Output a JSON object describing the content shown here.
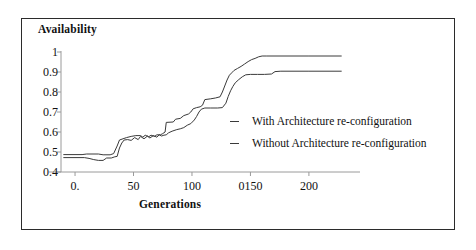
{
  "figure": {
    "frame_color": "#2b2b2b",
    "background": "#ffffff"
  },
  "chart_data": {
    "type": "line",
    "title": "",
    "ylabel": "Availability",
    "xlabel": "Generations",
    "xlim": [
      -12,
      230
    ],
    "ylim": [
      0.4,
      1.0
    ],
    "grid": false,
    "legend_position": "center-right",
    "y_ticks": [
      1,
      0.9,
      0.8,
      0.7,
      0.6,
      0.5,
      0.4
    ],
    "y_tick_labels": [
      "1",
      "0.9",
      "0.8",
      "0.7",
      "0.6",
      "0.5",
      "0.4"
    ],
    "x_ticks": [
      0,
      50,
      100,
      150,
      200
    ],
    "x_tick_labels": [
      "0.",
      "50",
      "100",
      "0150",
      "200"
    ],
    "line_color": "#3a3a3a",
    "series": [
      {
        "name": "With Architecture re-configuration",
        "points": [
          [
            -10,
            0.487
          ],
          [
            6,
            0.487
          ],
          [
            10,
            0.49
          ],
          [
            20,
            0.49
          ],
          [
            24,
            0.486
          ],
          [
            30,
            0.486
          ],
          [
            33,
            0.492
          ],
          [
            36,
            0.53
          ],
          [
            38,
            0.56
          ],
          [
            41,
            0.566
          ],
          [
            44,
            0.572
          ],
          [
            48,
            0.578
          ],
          [
            52,
            0.582
          ],
          [
            56,
            0.582
          ],
          [
            58,
            0.574
          ],
          [
            60,
            0.584
          ],
          [
            63,
            0.576
          ],
          [
            65,
            0.584
          ],
          [
            68,
            0.578
          ],
          [
            70,
            0.586
          ],
          [
            73,
            0.586
          ],
          [
            75,
            0.592
          ],
          [
            77,
            0.6
          ],
          [
            78,
            0.648
          ],
          [
            84,
            0.65
          ],
          [
            86,
            0.664
          ],
          [
            90,
            0.668
          ],
          [
            93,
            0.682
          ],
          [
            97,
            0.69
          ],
          [
            99,
            0.7
          ],
          [
            101,
            0.716
          ],
          [
            104,
            0.722
          ],
          [
            107,
            0.726
          ],
          [
            109,
            0.734
          ],
          [
            111,
            0.762
          ],
          [
            116,
            0.766
          ],
          [
            120,
            0.77
          ],
          [
            124,
            0.776
          ],
          [
            126,
            0.8
          ],
          [
            128,
            0.83
          ],
          [
            130,
            0.86
          ],
          [
            132,
            0.884
          ],
          [
            134,
            0.896
          ],
          [
            136,
            0.908
          ],
          [
            139,
            0.918
          ],
          [
            142,
            0.928
          ],
          [
            145,
            0.94
          ],
          [
            148,
            0.952
          ],
          [
            151,
            0.962
          ],
          [
            154,
            0.968
          ],
          [
            157,
            0.976
          ],
          [
            160,
            0.98
          ],
          [
            164,
            0.98
          ],
          [
            200,
            0.98
          ],
          [
            228,
            0.98
          ]
        ]
      },
      {
        "name": "Without Architecture re-configuration",
        "points": [
          [
            -10,
            0.472
          ],
          [
            8,
            0.472
          ],
          [
            12,
            0.468
          ],
          [
            16,
            0.462
          ],
          [
            20,
            0.458
          ],
          [
            24,
            0.458
          ],
          [
            27,
            0.47
          ],
          [
            31,
            0.47
          ],
          [
            34,
            0.476
          ],
          [
            36,
            0.478
          ],
          [
            38,
            0.52
          ],
          [
            40,
            0.545
          ],
          [
            42,
            0.56
          ],
          [
            45,
            0.562
          ],
          [
            48,
            0.558
          ],
          [
            51,
            0.572
          ],
          [
            54,
            0.562
          ],
          [
            56,
            0.578
          ],
          [
            59,
            0.566
          ],
          [
            62,
            0.58
          ],
          [
            64,
            0.57
          ],
          [
            67,
            0.582
          ],
          [
            70,
            0.574
          ],
          [
            72,
            0.586
          ],
          [
            74,
            0.58
          ],
          [
            76,
            0.584
          ],
          [
            78,
            0.586
          ],
          [
            80,
            0.596
          ],
          [
            83,
            0.604
          ],
          [
            87,
            0.612
          ],
          [
            90,
            0.616
          ],
          [
            93,
            0.622
          ],
          [
            96,
            0.634
          ],
          [
            99,
            0.642
          ],
          [
            102,
            0.66
          ],
          [
            104,
            0.678
          ],
          [
            106,
            0.7
          ],
          [
            108,
            0.714
          ],
          [
            111,
            0.72
          ],
          [
            116,
            0.72
          ],
          [
            122,
            0.72
          ],
          [
            126,
            0.722
          ],
          [
            129,
            0.744
          ],
          [
            131,
            0.778
          ],
          [
            133,
            0.806
          ],
          [
            135,
            0.828
          ],
          [
            137,
            0.846
          ],
          [
            140,
            0.862
          ],
          [
            143,
            0.876
          ],
          [
            146,
            0.886
          ],
          [
            150,
            0.888
          ],
          [
            156,
            0.888
          ],
          [
            162,
            0.888
          ],
          [
            168,
            0.89
          ],
          [
            171,
            0.902
          ],
          [
            176,
            0.904
          ],
          [
            200,
            0.904
          ],
          [
            228,
            0.904
          ]
        ]
      }
    ]
  },
  "legend": {
    "items": [
      {
        "label": "With Architecture re-configuration",
        "marker": "dash"
      },
      {
        "label": "Without Architecture re-configuration",
        "marker": "dash"
      }
    ]
  }
}
